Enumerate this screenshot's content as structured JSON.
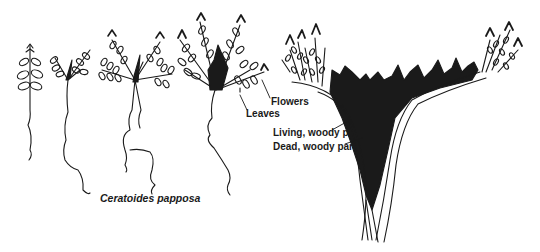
{
  "figure": {
    "species_name": "Ceratoides papposa",
    "stages": [
      {
        "id": "seedling-1",
        "description": "young seedling with few leaves"
      },
      {
        "id": "seedling-2",
        "description": "branching seedling"
      },
      {
        "id": "juvenile",
        "description": "juvenile plant with spreading branches"
      },
      {
        "id": "young-adult",
        "description": "young plant with woody center, flowers and leaves"
      },
      {
        "id": "mature",
        "description": "mature plant with split woody trunk"
      }
    ],
    "labels": {
      "flowers": "Flowers",
      "leaves": "Leaves",
      "living_woody": "Living, woody parts",
      "dead_woody": "Dead, woody parts"
    },
    "colors": {
      "ink": "#1a1a1a",
      "background": "#ffffff"
    }
  }
}
